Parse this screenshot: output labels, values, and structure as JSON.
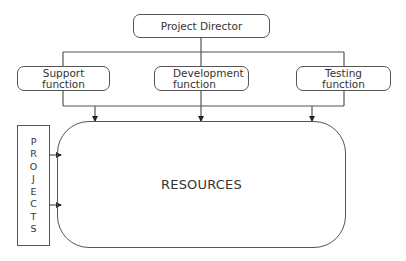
{
  "diagram": {
    "title_node": {
      "label": "Project Director"
    },
    "functions": [
      {
        "line1": "Support",
        "line2": "function"
      },
      {
        "line1": "Development",
        "line2": "function"
      },
      {
        "line1": "Testing",
        "line2": "function"
      }
    ],
    "resources": {
      "label": "RESOURCES"
    },
    "projects": {
      "letters": [
        "P",
        "R",
        "O",
        "J",
        "E",
        "C",
        "T",
        "S"
      ]
    },
    "colors": {
      "stroke": "#555555",
      "text": "#333333",
      "background": "#ffffff"
    }
  }
}
